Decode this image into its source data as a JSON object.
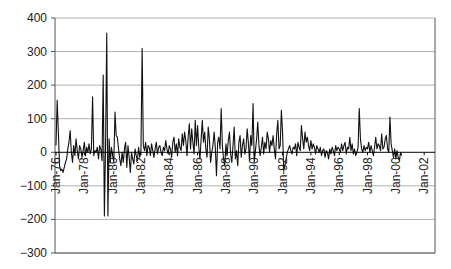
{
  "chart_data": {
    "type": "line",
    "title": "",
    "xlabel": "",
    "ylabel": "",
    "ylim": [
      -300,
      400
    ],
    "yticks": [
      400,
      300,
      200,
      100,
      0,
      -100,
      -200,
      -300
    ],
    "ytick_labels": [
      "400",
      "300",
      "200",
      "100",
      "0",
      "−100",
      "−200",
      "−300"
    ],
    "xtick_labels": [
      "Jan-76",
      "Jan-78",
      "Jan-80",
      "Jan-82",
      "Jan-84",
      "Jan-86",
      "Jan-88",
      "Jan-90",
      "Jan-92",
      "Jan-94",
      "Jan-96",
      "Jan-98",
      "Jan-00",
      "Jan-02"
    ],
    "x_frequency": "monthly",
    "x_start": "Jan-76",
    "grid": true,
    "legend": null,
    "colors": {
      "line": "#111111",
      "grid": "#b0b0b0",
      "zero_line": "#000000",
      "axis": "#555555"
    },
    "series": [
      {
        "name": "series",
        "values": [
          20,
          155,
          60,
          -40,
          -55,
          -50,
          -60,
          -45,
          -30,
          -20,
          10,
          30,
          65,
          0,
          -30,
          20,
          -10,
          40,
          5,
          -20,
          20,
          10,
          -15,
          5,
          30,
          -10,
          15,
          0,
          25,
          -5,
          10,
          165,
          -10,
          5,
          0,
          15,
          -20,
          20,
          10,
          -25,
          230,
          -190,
          20,
          355,
          -190,
          40,
          -30,
          15,
          -10,
          -30,
          120,
          50,
          45,
          10,
          -20,
          -40,
          0,
          -30,
          10,
          30,
          -45,
          20,
          -15,
          -60,
          0,
          -20,
          -35,
          10,
          -10,
          -25,
          15,
          -15,
          5,
          310,
          20,
          5,
          30,
          -10,
          20,
          15,
          -10,
          25,
          5,
          -15,
          10,
          30,
          -5,
          15,
          20,
          0,
          -10,
          15,
          5,
          35,
          10,
          -5,
          20,
          10,
          -15,
          30,
          45,
          0,
          25,
          -10,
          40,
          15,
          5,
          55,
          20,
          60,
          35,
          -10,
          45,
          85,
          10,
          70,
          30,
          -5,
          95,
          20,
          80,
          15,
          -20,
          40,
          95,
          30,
          60,
          10,
          -15,
          75,
          40,
          -30,
          0,
          20,
          60,
          15,
          -70,
          30,
          45,
          10,
          130,
          20,
          -20,
          -40,
          25,
          -10,
          35,
          60,
          -5,
          -30,
          20,
          75,
          -20,
          5,
          -40,
          30,
          50,
          -15,
          20,
          40,
          -5,
          10,
          70,
          30,
          -25,
          50,
          20,
          145,
          -30,
          5,
          40,
          90,
          20,
          -10,
          15,
          45,
          -5,
          30,
          10,
          60,
          40,
          0,
          35,
          20,
          50,
          10,
          -20,
          55,
          95,
          10,
          20,
          125,
          60,
          -55,
          -40,
          -20,
          0,
          10,
          20,
          5,
          -5,
          15,
          10,
          25,
          -10,
          30,
          15,
          5,
          80,
          40,
          10,
          60,
          30,
          45,
          20,
          5,
          35,
          10,
          25,
          15,
          -5,
          20,
          10,
          0,
          15,
          -10,
          5,
          10,
          -15,
          5,
          0,
          -20,
          10,
          -5,
          15,
          5,
          -10,
          20,
          5,
          15,
          10,
          0,
          25,
          5,
          20,
          30,
          -5,
          15,
          10,
          45,
          5,
          25,
          -5,
          10,
          -10,
          0,
          15,
          130,
          40,
          10,
          0,
          20,
          5,
          15,
          10,
          30,
          0,
          20,
          5,
          -10,
          15,
          45,
          10,
          25,
          20,
          5,
          55,
          10,
          15,
          40,
          50,
          10,
          0,
          105,
          25,
          5,
          -15,
          10,
          -20,
          5,
          -15,
          -25,
          0,
          -10
        ]
      }
    ]
  }
}
